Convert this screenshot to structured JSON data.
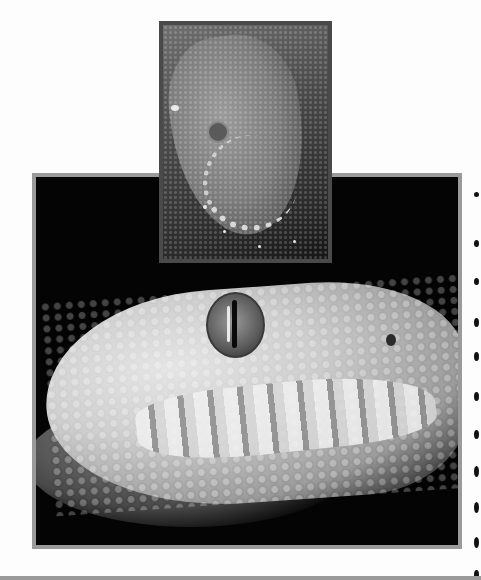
{
  "page": {
    "background": "#fdfdfd"
  },
  "photos": [
    {
      "id": "small",
      "subject": "dark snake head close-up, top-down",
      "frame_color": "#4a4a4a",
      "tone": "dark gray"
    },
    {
      "id": "large",
      "subject": "albino python head in profile with vertical slit pupil and labial pits",
      "frame_color": "#9a9a9a",
      "tone": "white on black"
    }
  ],
  "edge_marks": {
    "count": 11,
    "color": "#111111"
  }
}
